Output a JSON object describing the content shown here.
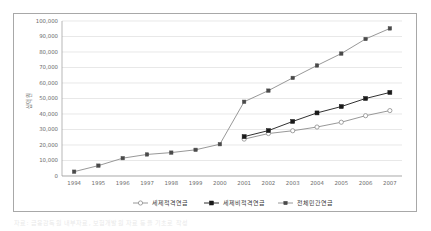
{
  "figure": {
    "caption": "자료: 금융감독원 내부자료, 보험개발원 자료 등을 기초로 작성"
  },
  "chart_data": {
    "type": "line",
    "title": "",
    "subtitle": "",
    "xlabel": "",
    "ylabel": "십억 원",
    "categories": [
      "1994",
      "1995",
      "1996",
      "1997",
      "1998",
      "1999",
      "2000",
      "2001",
      "2002",
      "2003",
      "2004",
      "2005",
      "2006",
      "2007"
    ],
    "ylim": [
      0,
      100000
    ],
    "ytick_step": 10000,
    "ytick_labels": [
      "0",
      "10,000",
      "20,000",
      "30,000",
      "40,000",
      "50,000",
      "60,000",
      "70,000",
      "80,000",
      "90,000",
      "100,000"
    ],
    "ytick_values": [
      0,
      10000,
      20000,
      30000,
      40000,
      50000,
      60000,
      70000,
      80000,
      90000,
      100000
    ],
    "grid": true,
    "grid_axis": "y",
    "legend_position": "bottom",
    "series": [
      {
        "name": "세제적격연금",
        "marker": "open-circle",
        "color": "#8c8c8c",
        "marker_fill": "#ffffff",
        "values": [
          null,
          null,
          null,
          null,
          null,
          null,
          null,
          23800,
          27400,
          29200,
          31600,
          34700,
          38900,
          42200
        ]
      },
      {
        "name": "세제비적격연금",
        "marker": "filled-square",
        "color": "#1a1a1a",
        "marker_fill": "#1a1a1a",
        "values": [
          null,
          null,
          null,
          null,
          null,
          null,
          null,
          25400,
          29300,
          35200,
          40700,
          44800,
          50000,
          53900
        ]
      },
      {
        "name": "전체민간연금",
        "marker": "filled-square-small",
        "color": "#8c8c8c",
        "marker_fill": "#4a4a4a",
        "values": [
          2800,
          6700,
          11500,
          13900,
          15100,
          16900,
          20500,
          47900,
          55100,
          63300,
          71300,
          79000,
          88400,
          95200
        ]
      }
    ]
  }
}
